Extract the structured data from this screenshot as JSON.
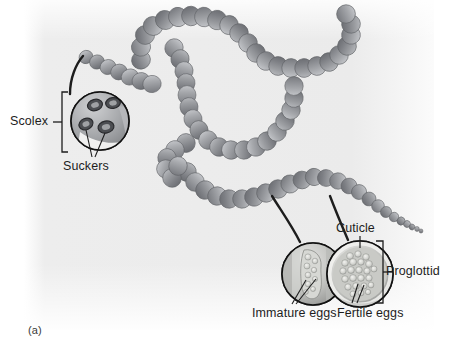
{
  "figure": {
    "panel_letter": "(a)",
    "background_color": "#ffffff",
    "panel_color": "#ececec",
    "body_color": "#8f9094",
    "line_color": "#1d1d1d"
  },
  "labels": {
    "scolex": "Scolex",
    "suckers": "Suckers",
    "cuticle": "Cuticle",
    "proglottid": "Proglottid",
    "immature_eggs": "Immature eggs",
    "fertile_eggs": "Fertile eggs"
  },
  "insets": {
    "scolex_inset": {
      "name": "scolex-detail-circle",
      "sucker_count": 4
    },
    "immature_inset": {
      "name": "immature-proglottid-cross-section"
    },
    "fertile_inset": {
      "name": "fertile-proglottid-cross-section"
    }
  }
}
